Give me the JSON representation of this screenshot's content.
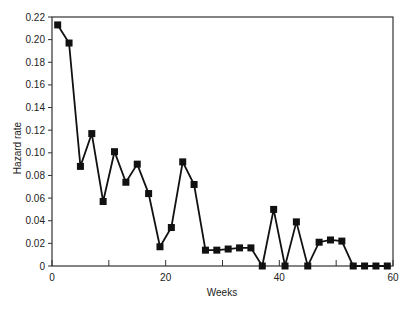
{
  "chart_data": {
    "type": "line",
    "title": "",
    "xlabel": "Weeks",
    "ylabel": "Hazard rate",
    "xlim": [
      0,
      60
    ],
    "ylim": [
      0,
      0.22
    ],
    "grid": false,
    "legend": null,
    "marker": "square",
    "x_ticks": [
      0,
      10,
      20,
      30,
      40,
      50,
      60
    ],
    "x_tick_labels": [
      "0",
      "",
      "20",
      "",
      "40",
      "",
      "60"
    ],
    "y_ticks": [
      0,
      0.02,
      0.04,
      0.06,
      0.08,
      0.1,
      0.12,
      0.14,
      0.16,
      0.18,
      0.2,
      0.22
    ],
    "y_tick_labels": [
      "0",
      "0.02",
      "0.04",
      "0.06",
      "0.08",
      "0.10",
      "0.12",
      "0.14",
      "0.16",
      "0.18",
      "0.20",
      "0.22"
    ],
    "series": [
      {
        "name": "Hazard rate",
        "x": [
          1,
          3,
          5,
          7,
          9,
          11,
          13,
          15,
          17,
          19,
          21,
          23,
          25,
          27,
          29,
          31,
          33,
          35,
          37,
          39,
          41,
          43,
          45,
          47,
          49,
          51,
          53,
          55,
          57,
          59
        ],
        "values": [
          0.213,
          0.197,
          0.088,
          0.117,
          0.057,
          0.101,
          0.074,
          0.09,
          0.064,
          0.017,
          0.034,
          0.092,
          0.072,
          0.014,
          0.014,
          0.015,
          0.016,
          0.016,
          0.0,
          0.05,
          0.0,
          0.039,
          0.0,
          0.021,
          0.023,
          0.022,
          0.0,
          0.0,
          0.0,
          0.0
        ]
      }
    ]
  }
}
